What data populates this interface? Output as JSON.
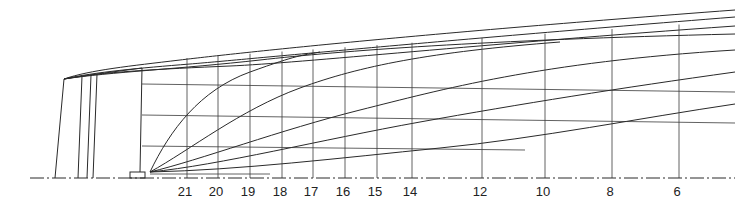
{
  "drawing": {
    "title": "Ship lines plan — profile (buttock lines, waterlines, stations)",
    "line_color": "#2a2a2a",
    "background": "#ffffff"
  },
  "baseline": {
    "y": 178,
    "x1": 30,
    "x2": 735
  },
  "stations": [
    {
      "label": "21",
      "x": 187
    },
    {
      "label": "20",
      "x": 218
    },
    {
      "label": "19",
      "x": 250
    },
    {
      "label": "18",
      "x": 282
    },
    {
      "label": "17",
      "x": 313
    },
    {
      "label": "16",
      "x": 345
    },
    {
      "label": "15",
      "x": 377
    },
    {
      "label": "14",
      "x": 412
    },
    {
      "label": "12",
      "x": 482
    },
    {
      "label": "10",
      "x": 545
    },
    {
      "label": "8",
      "x": 612
    },
    {
      "label": "6",
      "x": 679
    }
  ],
  "station_label_y": 196,
  "stern_verticals": [
    {
      "x1": 55,
      "y1": 178,
      "x2": 64,
      "y2": 79
    },
    {
      "x1": 78,
      "y1": 178,
      "x2": 82,
      "y2": 76
    },
    {
      "x1": 87,
      "y1": 178,
      "x2": 91,
      "y2": 75
    },
    {
      "x1": 93,
      "y1": 178,
      "x2": 97,
      "y2": 74
    },
    {
      "x1": 140,
      "y1": 172,
      "x2": 142,
      "y2": 68
    }
  ],
  "waterlines": [
    {
      "y1": 84,
      "y2": 92,
      "x1": 142,
      "x2": 735
    },
    {
      "y1": 115,
      "y2": 123,
      "x1": 142,
      "x2": 735
    },
    {
      "y1": 146,
      "y2": 150,
      "x1": 142,
      "x2": 525
    }
  ],
  "sheer_lines": [
    "M64,79 C90,70 130,66 180,60 S400,35 735,10",
    "M64,79 C95,72 140,68 190,64 S420,42 735,17",
    "M64,79 C100,72 160,69 230,66 S480,44 735,26",
    "M64,79 C110,72 180,69 260,60 S480,40 735,34"
  ],
  "buttock_lines": [
    "M150,172 C170,130 200,90 250,72 S300,56 320,52",
    "M150,172 C190,150 240,110 300,88 S430,52 560,42",
    "M150,172 C200,160 280,130 360,110 S540,62 735,50",
    "M150,172 C220,165 320,140 420,122 S620,88 735,72",
    "M150,172 C240,170 340,158 440,148 S640,118 735,104"
  ],
  "keel_plate": {
    "x": 130,
    "y": 172,
    "width": 15,
    "height": 6
  },
  "keel_extension": {
    "x1": 150,
    "y1": 174,
    "x2": 270,
    "y2": 174
  }
}
